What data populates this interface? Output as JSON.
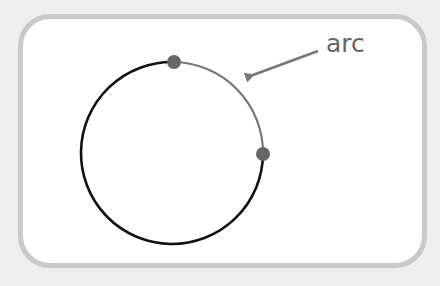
{
  "diagram": {
    "title": "",
    "colors": {
      "page_background": "#eeeeee",
      "frame_background": "#ffffff",
      "frame_border": "#c9c9c9",
      "circle_stroke": "#111111",
      "arc_stroke": "#777777",
      "point_fill": "#666666",
      "arrow": "#777777",
      "label": "#666666"
    },
    "circle": {
      "cx": 174,
      "cy": 153,
      "r": 91
    },
    "arc": {
      "from_point": "top",
      "to_point": "right",
      "start": {
        "x": 174,
        "y": 62
      },
      "end": {
        "x": 263,
        "y": 154
      }
    },
    "points": [
      {
        "name": "top",
        "x": 174,
        "y": 62,
        "r": 7
      },
      {
        "name": "right",
        "x": 263,
        "y": 154,
        "r": 7
      }
    ],
    "annotation": {
      "text": "arc",
      "text_x": 326,
      "text_y": 52,
      "arrow_from": {
        "x": 318,
        "y": 51
      },
      "arrow_to": {
        "x": 244,
        "y": 78
      }
    }
  }
}
